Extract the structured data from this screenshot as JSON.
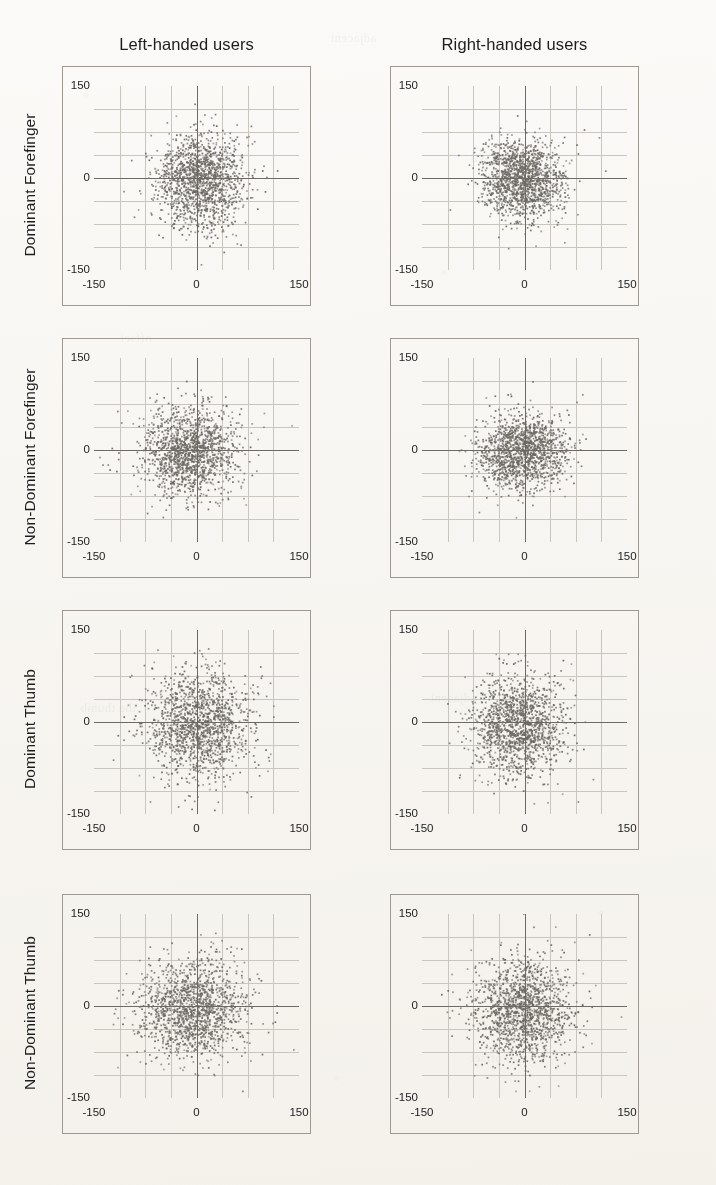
{
  "figure": {
    "type": "scatter-matrix",
    "background_color": "#fbfaf8",
    "point_color": "#6b6862",
    "axis_color": "#6e6b66",
    "grid_color": "#c9c6c0",
    "frame_color": "#9e9a93"
  },
  "columns": [
    {
      "id": "left-handed",
      "label": "Left-handed users"
    },
    {
      "id": "right-handed",
      "label": "Right-handed users"
    }
  ],
  "rows": [
    {
      "id": "dominant-forefinger",
      "label": "Dominant Forefinger"
    },
    {
      "id": "non-dominant-forefinger",
      "label": "Non-Dominant Forefinger"
    },
    {
      "id": "dominant-thumb",
      "label": "Dominant Thumb"
    },
    {
      "id": "non-dominant-thumb",
      "label": "Non-Dominant Thumb"
    }
  ],
  "axes": {
    "xlim": [
      -150,
      150
    ],
    "ylim": [
      -150,
      150
    ],
    "xticks": [
      -150,
      0,
      150
    ],
    "yticks": [
      -150,
      0,
      150
    ],
    "xtick_labels": [
      "-150",
      "0",
      "150"
    ],
    "ytick_labels": [
      "-150",
      "0",
      "150"
    ],
    "grid": true,
    "grid_divisions": 8,
    "xlabel": "",
    "ylabel": ""
  },
  "chart_data": {
    "type": "scatter",
    "title": "",
    "subtitle": "",
    "xlabel": "",
    "ylabel": "",
    "xlim": [
      -150,
      150
    ],
    "ylim": [
      -150,
      150
    ],
    "xticks": [
      -150,
      0,
      150
    ],
    "yticks": [
      -150,
      0,
      150
    ],
    "grid": true,
    "legend": null,
    "row_labels": [
      "Dominant Forefinger",
      "Non-Dominant Forefinger",
      "Dominant Thumb",
      "Non-Dominant Thumb"
    ],
    "column_labels": [
      "Left-handed users",
      "Right-handed users"
    ],
    "point_color": "#6b6862",
    "point_size_px": 1.7,
    "panels": [
      {
        "row": "Dominant Forefinger",
        "column": "Left-handed users",
        "n": 1450,
        "mean_x": 6,
        "mean_y": -4,
        "sd_x": 33,
        "sd_y": 38,
        "correlation": 0.05,
        "seed": 11
      },
      {
        "row": "Dominant Forefinger",
        "column": "Right-handed users",
        "n": 1450,
        "mean_x": -4,
        "mean_y": -3,
        "sd_x": 30,
        "sd_y": 33,
        "correlation": -0.05,
        "seed": 23
      },
      {
        "row": "Non-Dominant Forefinger",
        "column": "Left-handed users",
        "n": 1450,
        "mean_x": -8,
        "mean_y": -3,
        "sd_x": 37,
        "sd_y": 37,
        "correlation": 0.02,
        "seed": 37
      },
      {
        "row": "Non-Dominant Forefinger",
        "column": "Right-handed users",
        "n": 1450,
        "mean_x": -2,
        "mean_y": -4,
        "sd_x": 31,
        "sd_y": 30,
        "correlation": 0.04,
        "seed": 51
      },
      {
        "row": "Dominant Thumb",
        "column": "Left-handed users",
        "n": 1450,
        "mean_x": 2,
        "mean_y": -6,
        "sd_x": 38,
        "sd_y": 42,
        "correlation": 0.03,
        "seed": 67
      },
      {
        "row": "Dominant Thumb",
        "column": "Right-handed users",
        "n": 1450,
        "mean_x": -7,
        "mean_y": -6,
        "sd_x": 34,
        "sd_y": 40,
        "correlation": -0.03,
        "seed": 83
      },
      {
        "row": "Non-Dominant Thumb",
        "column": "Left-handed users",
        "n": 1450,
        "mean_x": -7,
        "mean_y": -5,
        "sd_x": 39,
        "sd_y": 41,
        "correlation": 0.02,
        "seed": 97
      },
      {
        "row": "Non-Dominant Thumb",
        "column": "Right-handed users",
        "n": 1450,
        "mean_x": -2,
        "mean_y": -5,
        "sd_x": 36,
        "sd_y": 40,
        "correlation": 0.04,
        "seed": 113
      }
    ]
  },
  "bleed_text": [
    "adjacent",
    "and the Wii",
    "offset",
    "condition",
    "the thumb"
  ]
}
